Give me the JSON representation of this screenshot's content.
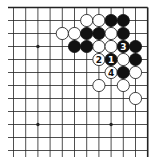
{
  "diagram": {
    "type": "go-board-fragment",
    "corner": "top-right",
    "colors": {
      "background": "#ffffff",
      "line": "#222222",
      "black_stone": "#111111",
      "white_stone": "#ffffff",
      "stone_outline": "#111111"
    },
    "grid": {
      "columns": 12,
      "rows": 12,
      "edges": [
        "top",
        "right"
      ]
    },
    "hoshi": [
      {
        "col": 2,
        "row": 3
      },
      {
        "col": 2,
        "row": 9
      },
      {
        "col": 8,
        "row": 9
      }
    ],
    "stones": [
      {
        "color": "white",
        "col": 6,
        "row": 1,
        "label": ""
      },
      {
        "color": "white",
        "col": 7,
        "row": 1,
        "label": ""
      },
      {
        "color": "black",
        "col": 8,
        "row": 1,
        "label": ""
      },
      {
        "color": "black",
        "col": 9,
        "row": 1,
        "label": ""
      },
      {
        "color": "white",
        "col": 4,
        "row": 2,
        "label": ""
      },
      {
        "color": "white",
        "col": 5,
        "row": 2,
        "label": ""
      },
      {
        "color": "black",
        "col": 6,
        "row": 2,
        "label": ""
      },
      {
        "color": "black",
        "col": 7,
        "row": 2,
        "label": ""
      },
      {
        "color": "white",
        "col": 8,
        "row": 2,
        "label": ""
      },
      {
        "color": "black",
        "col": 9,
        "row": 2,
        "label": ""
      },
      {
        "color": "black",
        "col": 5,
        "row": 3,
        "label": ""
      },
      {
        "color": "black",
        "col": 6,
        "row": 3,
        "label": ""
      },
      {
        "color": "white",
        "col": 7,
        "row": 3,
        "label": ""
      },
      {
        "color": "white",
        "col": 8,
        "row": 3,
        "label": ""
      },
      {
        "color": "black",
        "col": 9,
        "row": 3,
        "label": "3"
      },
      {
        "color": "black",
        "col": 10,
        "row": 3,
        "label": ""
      },
      {
        "color": "white",
        "col": 7,
        "row": 4,
        "label": "2"
      },
      {
        "color": "black",
        "col": 8,
        "row": 4,
        "label": "1"
      },
      {
        "color": "white",
        "col": 9,
        "row": 4,
        "label": ""
      },
      {
        "color": "black",
        "col": 10,
        "row": 4,
        "label": ""
      },
      {
        "color": "white",
        "col": 8,
        "row": 5,
        "label": "4"
      },
      {
        "color": "black",
        "col": 9,
        "row": 5,
        "label": ""
      },
      {
        "color": "white",
        "col": 10,
        "row": 5,
        "label": ""
      },
      {
        "color": "white",
        "col": 7,
        "row": 6,
        "label": ""
      },
      {
        "color": "white",
        "col": 9,
        "row": 6,
        "label": ""
      },
      {
        "color": "white",
        "col": 10,
        "row": 7,
        "label": ""
      }
    ]
  }
}
